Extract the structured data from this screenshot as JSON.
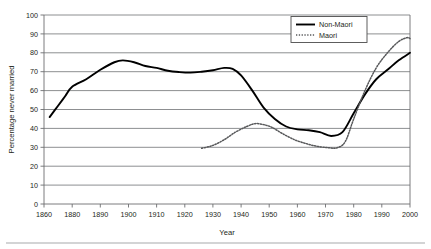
{
  "chart_data": {
    "type": "line",
    "title": "",
    "xlabel": "Year",
    "ylabel": "Percentage never married",
    "xlim": [
      1860,
      2000
    ],
    "ylim": [
      0,
      100
    ],
    "grid": true,
    "legend_position": "top-right",
    "x_tick_labels": [
      "1860",
      "1880",
      "1890",
      "1900",
      "1910",
      "1920",
      "1930",
      "1940",
      "1950",
      "1960",
      "1970",
      "1980",
      "1990",
      "2000"
    ],
    "y_tick_labels": [
      "0",
      "10",
      "20",
      "30",
      "40",
      "50",
      "60",
      "70",
      "80",
      "90",
      "100"
    ],
    "x": [
      1860,
      1880,
      1890,
      1900,
      1910,
      1920,
      1930,
      1940,
      1950,
      1960,
      1970,
      1980,
      1990,
      2000
    ],
    "series": [
      {
        "name": "Non-Maori",
        "style": "solid",
        "color": "#000000",
        "values": [
          46,
          62,
          72,
          76,
          72,
          69.5,
          71,
          68,
          50,
          40,
          36,
          48,
          70,
          80
        ]
      },
      {
        "name": "Maori",
        "style": "dotted",
        "color": "#58595b",
        "values": [
          null,
          null,
          null,
          null,
          null,
          null,
          30,
          41,
          40,
          34,
          30,
          43,
          75,
          88
        ]
      }
    ],
    "series_detail": [
      {
        "name": "Non-Maori",
        "points": [
          [
            1864,
            46
          ],
          [
            1870,
            52
          ],
          [
            1875,
            57
          ],
          [
            1880,
            62
          ],
          [
            1885,
            66
          ],
          [
            1890,
            71
          ],
          [
            1895,
            75
          ],
          [
            1898,
            76
          ],
          [
            1902,
            75
          ],
          [
            1906,
            73
          ],
          [
            1910,
            72
          ],
          [
            1914,
            70.5
          ],
          [
            1918,
            69.8
          ],
          [
            1922,
            69.5
          ],
          [
            1926,
            70
          ],
          [
            1930,
            70.8
          ],
          [
            1934,
            72
          ],
          [
            1937,
            71.5
          ],
          [
            1940,
            68
          ],
          [
            1944,
            60
          ],
          [
            1948,
            51
          ],
          [
            1952,
            45
          ],
          [
            1956,
            41
          ],
          [
            1960,
            39.5
          ],
          [
            1964,
            39
          ],
          [
            1968,
            38
          ],
          [
            1972,
            36
          ],
          [
            1976,
            38
          ],
          [
            1980,
            48
          ],
          [
            1984,
            58
          ],
          [
            1988,
            66
          ],
          [
            1992,
            71
          ],
          [
            1996,
            76
          ],
          [
            2000,
            80
          ]
        ]
      },
      {
        "name": "Maori",
        "points": [
          [
            1926,
            29.5
          ],
          [
            1930,
            31
          ],
          [
            1934,
            34
          ],
          [
            1938,
            38
          ],
          [
            1942,
            41
          ],
          [
            1945,
            42.5
          ],
          [
            1948,
            42
          ],
          [
            1951,
            40.5
          ],
          [
            1955,
            37
          ],
          [
            1959,
            34
          ],
          [
            1963,
            32
          ],
          [
            1967,
            30.5
          ],
          [
            1971,
            29.8
          ],
          [
            1974,
            29.7
          ],
          [
            1977,
            33
          ],
          [
            1980,
            45
          ],
          [
            1984,
            60
          ],
          [
            1988,
            72
          ],
          [
            1992,
            80
          ],
          [
            1996,
            86
          ],
          [
            1999,
            88
          ],
          [
            2000,
            87.5
          ]
        ]
      }
    ],
    "legend_entries": [
      {
        "label": "Non-Maori",
        "style": "solid"
      },
      {
        "label": "Maori",
        "style": "dotted"
      }
    ]
  }
}
